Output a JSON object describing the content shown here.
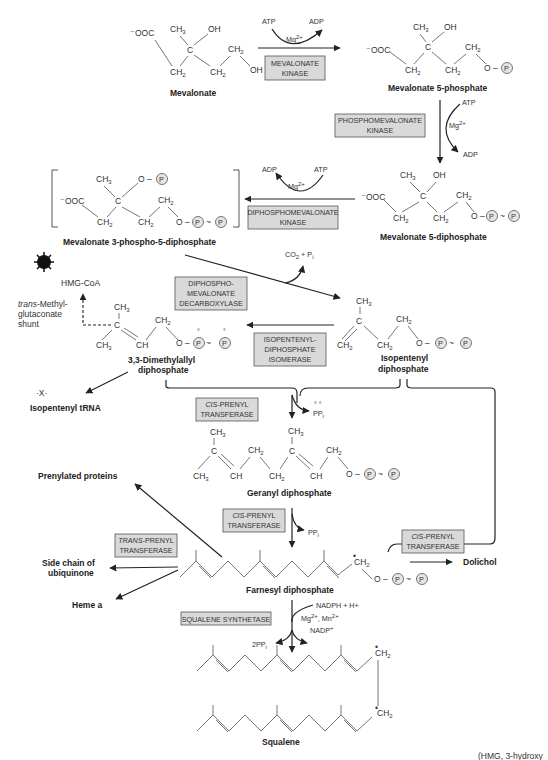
{
  "figure": {
    "caption_fragment": "(HMG, 3-hydroxy"
  },
  "compounds": {
    "mevalonate": "Mevalonate",
    "mevalonate_5p": "Mevalonate 5-phosphate",
    "mevalonate_5pp": "Mevalonate 5-diphosphate",
    "mevalonate_3p5pp": "Mevalonate 3-phospho-5-diphosphate",
    "dmapp_1": "3,3-Dimethylallyl",
    "dmapp_2": "diphosphate",
    "ipp_1": "Isopentenyl",
    "ipp_2": "diphosphate",
    "gpp": "Geranyl diphosphate",
    "fpp": "Farnesyl diphosphate",
    "squalene": "Squalene",
    "hmg_coa": "HMG-CoA",
    "isopentenyl_trna": "Isopentenyl tRNA",
    "prenylated_proteins": "Prenylated proteins",
    "ubiquinone_1": "Side chain of",
    "ubiquinone_2": "ubiquinone",
    "heme_a": "Heme a",
    "dolichol": "Dolichol"
  },
  "enzymes": {
    "mevalonate_kinase": [
      "MEVALONATE",
      "KINASE"
    ],
    "phosphomevalonate_kinase": [
      "PHOSPHOMEVALONATE",
      "KINASE"
    ],
    "diphosphomevalonate_kinase": [
      "DIPHOSPHOMEVALONATE",
      "KINASE"
    ],
    "decarboxylase": [
      "DIPHOSPHO-",
      "MEVALONATE",
      "DECARBOXYLASE"
    ],
    "isomerase": [
      "ISOPENTENYL-",
      "DIPHOSPHATE",
      "ISOMERASE"
    ],
    "cis_prenyl_1": [
      "CIS-PRENYL",
      "TRANSFERASE"
    ],
    "cis_prenyl_2": [
      "CIS-PRENYL",
      "TRANSFERASE"
    ],
    "cis_prenyl_3": [
      "CIS-PRENYL",
      "TRANSFERASE"
    ],
    "trans_prenyl": [
      "TRANS-PRENYL",
      "TRANSFERASE"
    ],
    "squalene_synthetase": "SQUALENE SYNTHETASE"
  },
  "cofactors": {
    "atp": "ATP",
    "adp": "ADP",
    "mg": "Mg",
    "mg_charge": "2+",
    "co2_pi": "CO2 + Pi",
    "ppi": "PPi",
    "two_ppi": "2PPi",
    "nadph": "NADPH + H+",
    "mg_mn": "Mg2+, Mn2+",
    "nadp": "NADP+"
  },
  "shunt_label": [
    "trans-Methyl-",
    "glutaconate",
    "shunt"
  ],
  "groups": {
    "ch3": "CH3",
    "ch2": "CH2",
    "oh": "OH",
    "c": "C",
    "ch": "CH",
    "ooc": "⁻OOC",
    "o": "O",
    "p": "P",
    "tilde": "~",
    "dash": "–"
  }
}
